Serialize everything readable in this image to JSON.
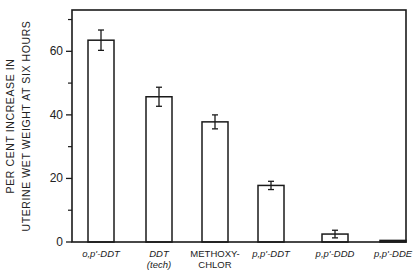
{
  "chart_data": {
    "type": "bar",
    "title": "",
    "xlabel": "",
    "ylabel": [
      "PER CENT INCREASE IN",
      "UTERINE WET WEIGHT AT SIX HOURS"
    ],
    "ylim": [
      0,
      73
    ],
    "yticks_major": [
      0,
      20,
      40,
      60
    ],
    "yticks_minor": [
      10,
      30,
      50,
      70
    ],
    "grid": false,
    "categories": [
      {
        "lines": [
          "o,p'-DDT"
        ],
        "italic": true
      },
      {
        "lines": [
          "DDT",
          "(tech)"
        ],
        "italic": true
      },
      {
        "lines": [
          "METHOXY-",
          "CHLOR"
        ],
        "italic": false
      },
      {
        "lines": [
          "p,p'-DDT"
        ],
        "italic": true
      },
      {
        "lines": [
          "p,p'-DDD"
        ],
        "italic": true
      },
      {
        "lines": [
          "p,p'-DDE"
        ],
        "italic": true
      }
    ],
    "values": [
      63.5,
      45.7,
      37.8,
      17.8,
      2.5,
      0.5
    ],
    "errors": [
      3.2,
      3.0,
      2.2,
      1.3,
      1.2,
      0
    ]
  },
  "colors": {
    "ink": "#1a1a1a",
    "bar_fill": "#ffffff",
    "background": "#ffffff"
  }
}
